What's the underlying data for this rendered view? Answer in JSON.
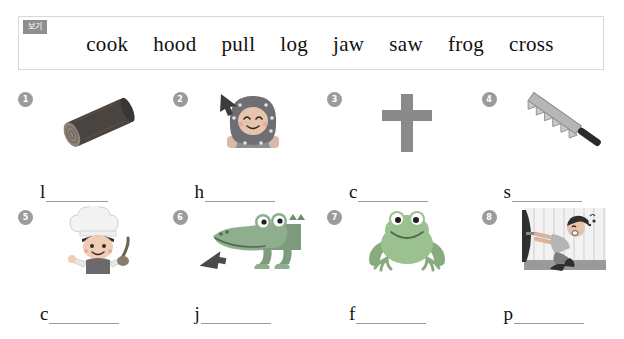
{
  "worksheet": {
    "wordbank": {
      "badge_label": "보기",
      "badge_color": "#8e8e8e",
      "words": [
        "cook",
        "hood",
        "pull",
        "log",
        "jaw",
        "saw",
        "frog",
        "cross"
      ]
    },
    "items": [
      {
        "number": "1",
        "icon": "log-icon",
        "picture_description": "dark wooden log",
        "first_letter": "l",
        "answer_word": "log"
      },
      {
        "number": "2",
        "icon": "child-in-hood-icon",
        "picture_description": "smiling child wearing a hood with arrow pointing at hood",
        "first_letter": "h",
        "answer_word": "hood"
      },
      {
        "number": "3",
        "icon": "cross-icon",
        "picture_description": "grey cross",
        "first_letter": "c",
        "answer_word": "cross"
      },
      {
        "number": "4",
        "icon": "saw-icon",
        "picture_description": "hand saw with toothed blade",
        "first_letter": "s",
        "answer_word": "saw"
      },
      {
        "number": "5",
        "icon": "cook-icon",
        "picture_description": "boy chef in tall hat holding a ladle",
        "first_letter": "c",
        "answer_word": "cook"
      },
      {
        "number": "6",
        "icon": "crocodile-jaw-icon",
        "picture_description": "crocodile head with arrow pointing at its jaw",
        "first_letter": "j",
        "answer_word": "jaw"
      },
      {
        "number": "7",
        "icon": "frog-icon",
        "picture_description": "green frog facing forward",
        "first_letter": "f",
        "answer_word": "frog"
      },
      {
        "number": "8",
        "icon": "pull-door-icon",
        "picture_description": "boy pulling a door handle",
        "first_letter": "p",
        "answer_word": "pull"
      }
    ]
  }
}
